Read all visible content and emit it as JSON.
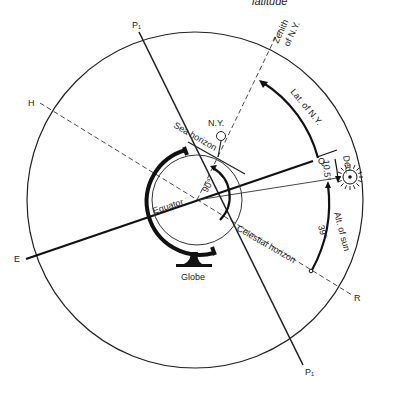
{
  "title_partial": "latitude",
  "labels": {
    "p_top": "P₁",
    "p_bottom": "P₁",
    "h": "H",
    "e": "E",
    "q": "Q",
    "r": "R",
    "zenith_line1": "Zenith",
    "zenith_line2": "of N.Y.",
    "lat_ny": "Lat. of N.Y.",
    "ny": "N.Y.",
    "sea_horizon": "Sea horizon",
    "equator": "Equator",
    "angle_90": "90°",
    "dec": "Dec.",
    "dec_value": "10.5°",
    "alt_sun": "Alt. of sun",
    "alt_value": "39°",
    "celestial_horizon": "Celestial horizon",
    "globe": "Globe"
  },
  "colors": {
    "ink": "#222222",
    "background": "#ffffff"
  }
}
